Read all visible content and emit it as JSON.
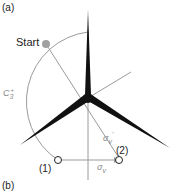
{
  "panel_labels": {
    "top": "(a)",
    "bottom": "(b)"
  },
  "labels": {
    "start": "Start",
    "c3": "C",
    "c3_sub": "3",
    "c3_sup": "+",
    "sigma_v_prime": "σ",
    "sigma_v_prime_sub": "v",
    "sigma_v_prime_sup": "'",
    "sigma_v": "σ",
    "sigma_v_sub": "v",
    "point1": "(1)",
    "point2": "(2)"
  },
  "colors": {
    "blade": "#111111",
    "construction": "#9a9a9a",
    "start_dot": "#a0a0a0"
  }
}
